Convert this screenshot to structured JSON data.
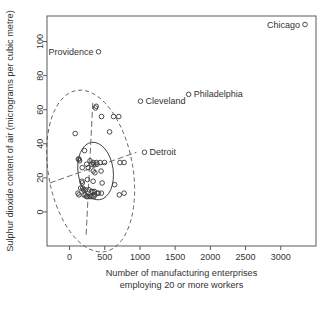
{
  "chart_data": {
    "type": "scatter",
    "title": "",
    "xlabel": "Number of manufacturing enterprises employing 20 or more workers",
    "xlabel_line1": "Number of manufacturing enterprises",
    "xlabel_line2": "employing 20 or more workers",
    "ylabel": "Sulphur dioxide content of air (micrograms  per cubic metre)",
    "xlim": [
      -320,
      3500
    ],
    "ylim": [
      -20,
      115
    ],
    "xticks": [
      0,
      500,
      1000,
      1500,
      2000,
      2500,
      3000
    ],
    "xticklabels": [
      "0",
      "500",
      "1000",
      "1500",
      "2000",
      "2500",
      "3000"
    ],
    "yticks": [
      0,
      20,
      40,
      60,
      80,
      100
    ],
    "yticklabels": [
      "0",
      "20",
      "40",
      "60",
      "80",
      "100"
    ],
    "grid": false,
    "legend": null,
    "marker": "open-circle",
    "points": [
      {
        "x": 3344,
        "y": 110,
        "label": "Chicago",
        "label_pos": "left"
      },
      {
        "x": 412,
        "y": 94,
        "label": "Providence",
        "label_pos": "left"
      },
      {
        "x": 1692,
        "y": 69,
        "label": "Philadelphia",
        "label_pos": "right"
      },
      {
        "x": 1007,
        "y": 65,
        "label": "Cleveland",
        "label_pos": "right"
      },
      {
        "x": 1064,
        "y": 35,
        "label": "Detroit",
        "label_pos": "right"
      },
      {
        "x": 368,
        "y": 61
      },
      {
        "x": 379,
        "y": 62
      },
      {
        "x": 454,
        "y": 56
      },
      {
        "x": 625,
        "y": 56
      },
      {
        "x": 699,
        "y": 56
      },
      {
        "x": 569,
        "y": 47
      },
      {
        "x": 80,
        "y": 46
      },
      {
        "x": 213,
        "y": 36
      },
      {
        "x": 125,
        "y": 31
      },
      {
        "x": 136,
        "y": 31
      },
      {
        "x": 142,
        "y": 30
      },
      {
        "x": 291,
        "y": 30
      },
      {
        "x": 334,
        "y": 29
      },
      {
        "x": 381,
        "y": 29
      },
      {
        "x": 434,
        "y": 29
      },
      {
        "x": 497,
        "y": 29
      },
      {
        "x": 717,
        "y": 29
      },
      {
        "x": 775,
        "y": 29
      },
      {
        "x": 244,
        "y": 28
      },
      {
        "x": 316,
        "y": 28
      },
      {
        "x": 347,
        "y": 28
      },
      {
        "x": 391,
        "y": 28
      },
      {
        "x": 180,
        "y": 26
      },
      {
        "x": 266,
        "y": 26
      },
      {
        "x": 337,
        "y": 24
      },
      {
        "x": 448,
        "y": 24
      },
      {
        "x": 361,
        "y": 23
      },
      {
        "x": 254,
        "y": 19
      },
      {
        "x": 176,
        "y": 18
      },
      {
        "x": 335,
        "y": 18
      },
      {
        "x": 181,
        "y": 17
      },
      {
        "x": 463,
        "y": 17
      },
      {
        "x": 641,
        "y": 16
      },
      {
        "x": 158,
        "y": 14
      },
      {
        "x": 186,
        "y": 14
      },
      {
        "x": 199,
        "y": 13
      },
      {
        "x": 227,
        "y": 13
      },
      {
        "x": 275,
        "y": 13
      },
      {
        "x": 311,
        "y": 12
      },
      {
        "x": 330,
        "y": 12
      },
      {
        "x": 354,
        "y": 12
      },
      {
        "x": 391,
        "y": 11
      },
      {
        "x": 412,
        "y": 11
      },
      {
        "x": 453,
        "y": 11
      },
      {
        "x": 775,
        "y": 11
      },
      {
        "x": 133,
        "y": 10
      },
      {
        "x": 204,
        "y": 10
      },
      {
        "x": 224,
        "y": 10
      },
      {
        "x": 241,
        "y": 9
      },
      {
        "x": 262,
        "y": 9
      },
      {
        "x": 293,
        "y": 9
      },
      {
        "x": 318,
        "y": 9
      },
      {
        "x": 344,
        "y": 9
      },
      {
        "x": 361,
        "y": 10
      },
      {
        "x": 707,
        "y": 10
      },
      {
        "x": 120,
        "y": 11
      }
    ],
    "ellipses": [
      {
        "name": "inner-solid-ellipse",
        "style": "solid",
        "cx": 370,
        "cy": 24,
        "rx": 250,
        "ry": 17,
        "rotate": -8
      },
      {
        "name": "outer-dashed-ellipse",
        "style": "dashed",
        "cx": 300,
        "cy": 24,
        "rx": 600,
        "ry": 48,
        "rotate": -10
      }
    ],
    "axis_lines": [
      {
        "name": "major-axis-line",
        "x1": -280,
        "y1": 17,
        "x2": 950,
        "y2": 35
      },
      {
        "name": "minor-axis-line",
        "x1": 330,
        "y1": 64,
        "x2": 235,
        "y2": -14
      }
    ]
  }
}
